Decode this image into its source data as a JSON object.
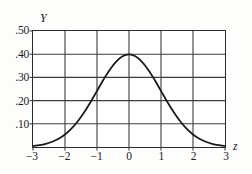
{
  "figure": {
    "background_color": "#fdfdfc",
    "frame_color": "#2a2a2a",
    "grid_color": "#3c3c3c",
    "curve_color": "#1a1a1a"
  },
  "axes": {
    "y_title": "Y",
    "x_title": "z",
    "y_tick_labels": [
      ".50",
      ".40",
      ".30",
      ".20",
      ".10"
    ],
    "x_tick_labels": [
      "−3",
      "−2",
      "−1",
      "0",
      "1",
      "2",
      "3"
    ]
  },
  "chart_data": {
    "type": "line",
    "title": "",
    "subtitle": "",
    "xlabel": "z",
    "ylabel": "Y",
    "xlim": [
      -3,
      3
    ],
    "ylim": [
      0,
      0.5
    ],
    "grid": true,
    "legend": "none",
    "xticks": [
      -3,
      -2,
      -1,
      0,
      1,
      2,
      3
    ],
    "xticklabels": [
      "−3",
      "−2",
      "−1",
      "0",
      "1",
      "2",
      "3"
    ],
    "yticks": [
      0.1,
      0.2,
      0.3,
      0.4,
      0.5
    ],
    "yticklabels": [
      ".10",
      ".20",
      ".30",
      ".40",
      ".50"
    ],
    "annotations": [],
    "series": [
      {
        "name": "standard normal density",
        "x": [
          -3,
          -2.8,
          -2.6,
          -2.4,
          -2.2,
          -2,
          -1.8,
          -1.6,
          -1.4,
          -1.2,
          -1,
          -0.8,
          -0.6,
          -0.4,
          -0.2,
          0,
          0.2,
          0.4,
          0.6,
          0.8,
          1,
          1.2,
          1.4,
          1.6,
          1.8,
          2,
          2.2,
          2.4,
          2.6,
          2.8,
          3
        ],
        "y": [
          0.0044,
          0.0079,
          0.0136,
          0.0224,
          0.0355,
          0.054,
          0.079,
          0.1109,
          0.1497,
          0.1942,
          0.242,
          0.2897,
          0.3332,
          0.3683,
          0.391,
          0.3989,
          0.391,
          0.3683,
          0.3332,
          0.2897,
          0.242,
          0.1942,
          0.1497,
          0.1109,
          0.079,
          0.054,
          0.0355,
          0.0224,
          0.0136,
          0.0079,
          0.0044
        ]
      }
    ]
  }
}
